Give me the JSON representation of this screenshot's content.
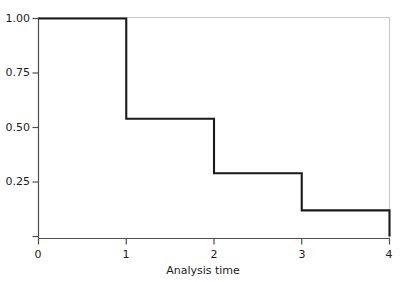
{
  "figure": {
    "title_remnant": "",
    "background_color": "#ffffff",
    "line_color": "#1a1a1a",
    "axis_color": "#4d4d4d",
    "frame_color": "#c8c8c8"
  },
  "chart_data": {
    "type": "line",
    "subtype": "step-post",
    "title": "",
    "xlabel": "Analysis time",
    "ylabel": "",
    "xlim": [
      0,
      4
    ],
    "ylim": [
      0,
      1
    ],
    "grid": false,
    "legend": null,
    "xticks": [
      0,
      1,
      2,
      3,
      4
    ],
    "xtick_labels": [
      "0",
      "1",
      "2",
      "3",
      "4"
    ],
    "yticks": [
      0.25,
      0.5,
      0.75,
      1.0
    ],
    "ytick_labels": [
      "0.25",
      "0.50",
      "0.75",
      "1.00"
    ],
    "series": [
      {
        "name": "Survivor function",
        "x": [
          0,
          1,
          1,
          2,
          2,
          3,
          3,
          4,
          4
        ],
        "y": [
          1.0,
          1.0,
          0.54,
          0.54,
          0.29,
          0.29,
          0.12,
          0.12,
          0.0
        ],
        "steps": [
          {
            "t_start": 0,
            "t_end": 1,
            "value": 1.0
          },
          {
            "t_start": 1,
            "t_end": 2,
            "value": 0.54
          },
          {
            "t_start": 2,
            "t_end": 3,
            "value": 0.29
          },
          {
            "t_start": 3,
            "t_end": 4,
            "value": 0.12
          },
          {
            "t_start": 4,
            "t_end": 4,
            "value": 0.0
          }
        ]
      }
    ]
  }
}
